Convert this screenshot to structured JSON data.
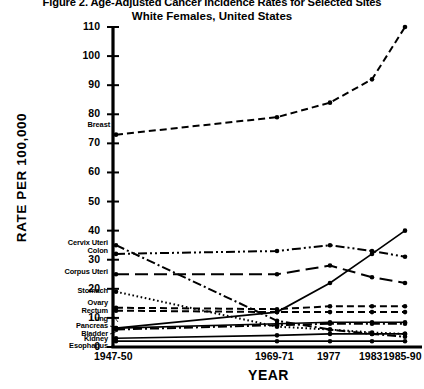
{
  "figure": {
    "title_main": "Figure 2. Age-Adjusted Cancer Incidence Rates for Selected Sites",
    "title_sub": "White Females, United States",
    "xlabel": "YEAR",
    "ylabel": "RATE PER 100,000"
  },
  "chart_data": {
    "type": "line",
    "title": "Figure 2. Age-Adjusted Cancer Incidence Rates for Selected Sites",
    "subtitle": "White Females, United States",
    "xlabel": "YEAR",
    "ylabel": "RATE PER 100,000",
    "categories": [
      "1947-50",
      "1969-71",
      "1977",
      "1983",
      "1985-90"
    ],
    "ylim": [
      0,
      110
    ],
    "yticks": [
      0,
      10,
      20,
      30,
      40,
      50,
      60,
      70,
      80,
      90,
      100,
      110
    ],
    "grid": false,
    "legend": "inline-left-labels",
    "series": [
      {
        "name": "Breast",
        "values": [
          73,
          79,
          84,
          92,
          110
        ],
        "style": "dashed"
      },
      {
        "name": "Cervix Uteri",
        "values": [
          35,
          9,
          6,
          4.5,
          3.5
        ],
        "style": "dashdot"
      },
      {
        "name": "Colon",
        "values": [
          32,
          33,
          35,
          33,
          31
        ],
        "style": "dashdotdot"
      },
      {
        "name": "Corpus Uteri",
        "values": [
          25,
          25,
          28,
          24,
          22
        ],
        "style": "longdash"
      },
      {
        "name": "Stomach",
        "values": [
          19,
          7,
          6,
          5,
          4.5
        ],
        "style": "dotted"
      },
      {
        "name": "Ovary",
        "values": [
          13.5,
          13,
          14,
          14,
          14
        ],
        "style": "dashed"
      },
      {
        "name": "Rectum",
        "values": [
          12.5,
          12,
          12,
          12,
          12
        ],
        "style": "dashed"
      },
      {
        "name": "Lung",
        "values": [
          6.5,
          12,
          22,
          32,
          40
        ],
        "style": "solid"
      },
      {
        "name": "Pancreas",
        "values": [
          6.5,
          8,
          8.5,
          8.5,
          8.5
        ],
        "style": "solid"
      },
      {
        "name": "Bladder",
        "values": [
          6,
          7.5,
          8,
          8,
          8
        ],
        "style": "dashdot"
      },
      {
        "name": "Kidney",
        "values": [
          3,
          4,
          4.5,
          4.5,
          4.5
        ],
        "style": "solid"
      },
      {
        "name": "Esophagus",
        "values": [
          2,
          2,
          2,
          2,
          2
        ],
        "style": "solid"
      }
    ]
  },
  "axes": {
    "yticks": [
      "110",
      "100",
      "90",
      "80",
      "70",
      "60",
      "50",
      "40",
      "30",
      "20",
      "10",
      "0"
    ],
    "xticks": [
      "1947-50",
      "1969-71",
      "1977",
      "1983",
      "1985-90"
    ]
  },
  "site_labels": [
    "Breast",
    "Cervix Uteri",
    "Colon",
    "Corpus Uteri",
    "Stomach",
    "Ovary",
    "Rectum",
    "Lung",
    "Pancreas",
    "Bladder",
    "Kidney",
    "Esophagus"
  ]
}
